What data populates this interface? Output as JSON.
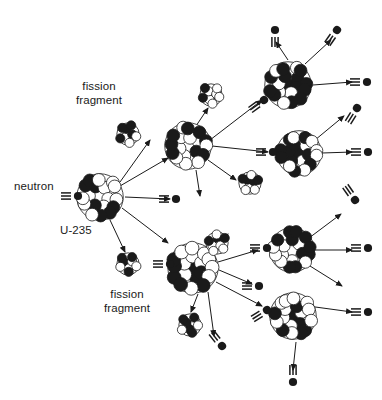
{
  "figure": {
    "background_color": "#ffffff",
    "ink_color": "#1a1a1a",
    "width": 382,
    "height": 400
  },
  "labels": [
    {
      "id": "neutron",
      "text": "neutron",
      "x": 14,
      "y": 180,
      "align": "left"
    },
    {
      "id": "u235",
      "text": "U-235",
      "x": 60,
      "y": 224,
      "align": "left"
    },
    {
      "id": "fission-fragment-top-line1",
      "text": "fission",
      "x": 99,
      "y": 80,
      "align": "center"
    },
    {
      "id": "fission-fragment-top-line2",
      "text": "fragment",
      "x": 99,
      "y": 94,
      "align": "center"
    },
    {
      "id": "fission-fragment-bottom-line1",
      "text": "fission",
      "x": 127,
      "y": 288,
      "align": "center"
    },
    {
      "id": "fission-fragment-bottom-line2",
      "text": "fragment",
      "x": 127,
      "y": 302,
      "align": "center"
    }
  ],
  "legend_semantics": {
    "neutron_glyph": "black filled circle with three short parallel speed lines trailing behind",
    "nucleus_glyph": "cluster of small black and white spheres (uranium-235 nucleus)",
    "fragment_glyph": "small cluster of black and white spheres (fission fragment)",
    "arrow_glyph": "thin straight line with solid triangular arrowhead"
  },
  "chain": {
    "generations": 4,
    "description": "One incoming neutron strikes a U-235 nucleus; each fission releases neutrons and two fission fragments, and released neutrons strike further U-235 nuclei in a branching cascade."
  },
  "nuclei": [
    {
      "id": "nucleus-gen1",
      "generation": 1,
      "cx": 100,
      "cy": 197,
      "r": 25
    },
    {
      "id": "nucleus-gen2",
      "generation": 2,
      "cx": 188,
      "cy": 146,
      "r": 25
    },
    {
      "id": "nucleus-gen2b",
      "generation": 2,
      "cx": 193,
      "cy": 268,
      "r": 27
    },
    {
      "id": "nucleus-gen3a",
      "generation": 3,
      "cx": 288,
      "cy": 85,
      "r": 25
    },
    {
      "id": "nucleus-gen3b",
      "generation": 3,
      "cx": 299,
      "cy": 153,
      "r": 24
    },
    {
      "id": "nucleus-gen3c",
      "generation": 3,
      "cx": 292,
      "cy": 250,
      "r": 24
    },
    {
      "id": "nucleus-gen3d",
      "generation": 3,
      "cx": 293,
      "cy": 316,
      "r": 25
    }
  ],
  "fragments": [
    {
      "id": "fragment-top-left",
      "cx": 128,
      "cy": 134,
      "r": 12
    },
    {
      "id": "fragment-mid-top",
      "cx": 211,
      "cy": 95,
      "r": 12
    },
    {
      "id": "fragment-mid-right",
      "cx": 250,
      "cy": 183,
      "r": 12
    },
    {
      "id": "fragment-bottom-left",
      "cx": 128,
      "cy": 264,
      "r": 12
    },
    {
      "id": "fragment-bottom-mid",
      "cx": 190,
      "cy": 325,
      "r": 12
    },
    {
      "id": "fragment-bottom-up",
      "cx": 217,
      "cy": 243,
      "r": 12
    }
  ],
  "neutrons": [
    {
      "id": "neutron-incoming",
      "x": 78,
      "y": 196,
      "angle": 0,
      "label": "incoming neutron"
    },
    {
      "id": "neutron-out-1",
      "x": 275,
      "y": 30,
      "angle": -90,
      "label": "released neutron"
    },
    {
      "id": "neutron-out-2",
      "x": 337,
      "y": 30,
      "angle": -55,
      "label": "released neutron"
    },
    {
      "id": "neutron-out-3",
      "x": 367,
      "y": 82,
      "angle": 0,
      "label": "released neutron"
    },
    {
      "id": "neutron-out-4",
      "x": 357,
      "y": 108,
      "angle": -58,
      "label": "released neutron"
    },
    {
      "id": "neutron-in-3a",
      "x": 264,
      "y": 100,
      "angle": -36,
      "label": "absorbed neutron"
    },
    {
      "id": "neutron-in-3b",
      "x": 273,
      "y": 152,
      "angle": 0,
      "label": "absorbed neutron"
    },
    {
      "id": "neutron-out-5",
      "x": 368,
      "y": 152,
      "angle": 0,
      "label": "released neutron"
    },
    {
      "id": "neutron-out-6",
      "x": 355,
      "y": 200,
      "angle": 55,
      "label": "released neutron"
    },
    {
      "id": "neutron-mid-free",
      "x": 176,
      "y": 199,
      "angle": 0,
      "label": "released neutron"
    },
    {
      "id": "neutron-in-gen2b",
      "x": 170,
      "y": 264,
      "angle": 0,
      "label": "absorbed neutron"
    },
    {
      "id": "neutron-in-3c",
      "x": 267,
      "y": 248,
      "angle": 0,
      "label": "absorbed neutron"
    },
    {
      "id": "neutron-out-7",
      "x": 368,
      "y": 248,
      "angle": 0,
      "label": "released neutron"
    },
    {
      "id": "neutron-out-8",
      "x": 259,
      "y": 286,
      "angle": 0,
      "label": "released neutron"
    },
    {
      "id": "neutron-out-9",
      "x": 222,
      "y": 346,
      "angle": 52,
      "label": "released neutron"
    },
    {
      "id": "neutron-in-3d",
      "x": 267,
      "y": 310,
      "angle": -32,
      "label": "absorbed neutron"
    },
    {
      "id": "neutron-out-10",
      "x": 368,
      "y": 312,
      "angle": 0,
      "label": "released neutron"
    },
    {
      "id": "neutron-out-11",
      "x": 293,
      "y": 382,
      "angle": 90,
      "label": "released neutron"
    }
  ]
}
